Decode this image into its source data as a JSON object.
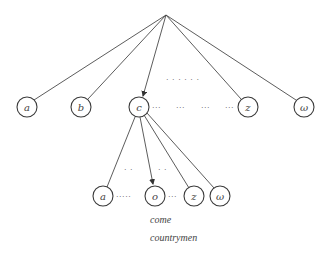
{
  "diagram": {
    "type": "tree",
    "root": {
      "x": 166,
      "y": 15
    },
    "top_row": {
      "y": 107,
      "radius": 10,
      "nodes": [
        {
          "label": "a",
          "x": 27
        },
        {
          "label": "b",
          "x": 81
        },
        {
          "label": "c",
          "x": 139,
          "highlighted_edge": true
        },
        {
          "label": "z",
          "x": 248
        },
        {
          "label": "ω",
          "x": 304
        }
      ],
      "ellipsis_between_c_and_z": [
        "···",
        "···",
        "···",
        "···"
      ],
      "ellipsis_above": "· · · · · ·"
    },
    "bottom_row": {
      "y": 196,
      "radius": 10,
      "parent": "c",
      "nodes": [
        {
          "label": "a",
          "x": 103
        },
        {
          "label": "o",
          "x": 155,
          "highlighted_edge": true
        },
        {
          "label": "z",
          "x": 194
        },
        {
          "label": "ω",
          "x": 220
        }
      ],
      "ellipsis_a_to_o": "·····",
      "ellipsis_o_to_z": "···",
      "ellipsis_above": [
        "· ·",
        "· ·"
      ]
    },
    "words": [
      "come",
      "countrymen"
    ]
  }
}
